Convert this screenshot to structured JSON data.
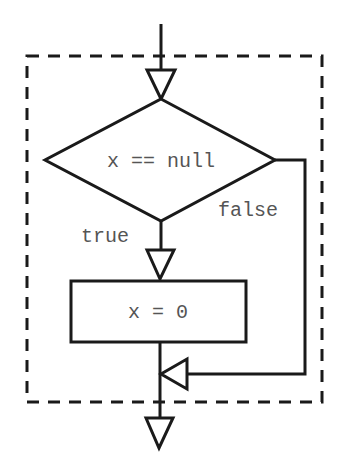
{
  "diagram": {
    "type": "flowchart",
    "group": {
      "style": "dashed",
      "label": ""
    },
    "nodes": [
      {
        "id": "cond",
        "kind": "decision",
        "text": "x == null"
      },
      {
        "id": "assign",
        "kind": "process",
        "text": "x = 0"
      }
    ],
    "edges": [
      {
        "from": "entry",
        "to": "cond",
        "label": ""
      },
      {
        "from": "cond",
        "to": "assign",
        "label": "true"
      },
      {
        "from": "cond",
        "to": "merge",
        "label": "false"
      },
      {
        "from": "assign",
        "to": "merge",
        "label": ""
      },
      {
        "from": "merge",
        "to": "exit",
        "label": ""
      }
    ],
    "labels": {
      "condition": "x == null",
      "true_branch": "true",
      "false_branch": "false",
      "action": "x = 0"
    }
  }
}
